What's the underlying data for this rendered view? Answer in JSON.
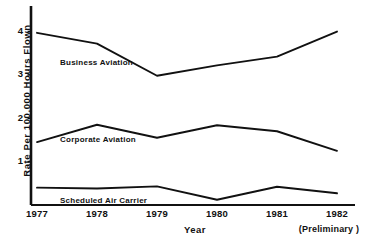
{
  "chart_data": {
    "type": "line",
    "title": "",
    "xlabel": "Year",
    "ylabel": "Rate  Per  100,000  Hours  Flown",
    "categories": [
      "1977",
      "1978",
      "1979",
      "1980",
      "1981",
      "1982"
    ],
    "x_tick_labels": [
      "1977",
      "1978",
      "1979",
      "1980",
      "1981",
      "1982"
    ],
    "y_tick_labels": [
      "4",
      "3",
      "2",
      "1"
    ],
    "y_tick_values": [
      4,
      3,
      2,
      1
    ],
    "ylim": [
      0,
      4.45
    ],
    "xlim_categories": [
      "1977",
      "1982"
    ],
    "grid": false,
    "legend_position": "inline-labels",
    "annotations": [
      {
        "text": "(Preliminary )",
        "near": "1982",
        "position": "below-axis-right"
      },
      {
        "text": "Year",
        "position": "below-axis-center"
      }
    ],
    "series": [
      {
        "name": "Business Aviation",
        "label": "Business Aviation",
        "values": [
          3.97,
          3.72,
          2.98,
          3.22,
          3.42,
          4.0
        ],
        "color": "#111111"
      },
      {
        "name": "Corporate Aviation",
        "label": "Corporate Aviation",
        "values": [
          1.45,
          1.85,
          1.55,
          1.84,
          1.7,
          1.25
        ],
        "color": "#111111"
      },
      {
        "name": "Scheduled Air Carrier",
        "label": "Scheduled Air Carrier",
        "values": [
          0.4,
          0.38,
          0.43,
          0.12,
          0.42,
          0.27
        ],
        "color": "#111111"
      }
    ]
  },
  "axis": {
    "y_title": "Rate  Per  100,000  Hours  Flown",
    "x_title": "Year",
    "preliminary_note": "(Preliminary )",
    "y_ticks": [
      {
        "label": "4"
      },
      {
        "label": "3"
      },
      {
        "label": "2"
      },
      {
        "label": "1"
      }
    ],
    "x_ticks": [
      {
        "label": "1977"
      },
      {
        "label": "1978"
      },
      {
        "label": "1979"
      },
      {
        "label": "1980"
      },
      {
        "label": "1981"
      },
      {
        "label": "1982"
      }
    ]
  },
  "series_labels": {
    "business": "Business Aviation",
    "corporate": "Corporate Aviation",
    "scheduled": "Scheduled Air Carrier"
  },
  "colors": {
    "line": "#111111",
    "axis": "#111111",
    "background": "#ffffff"
  }
}
